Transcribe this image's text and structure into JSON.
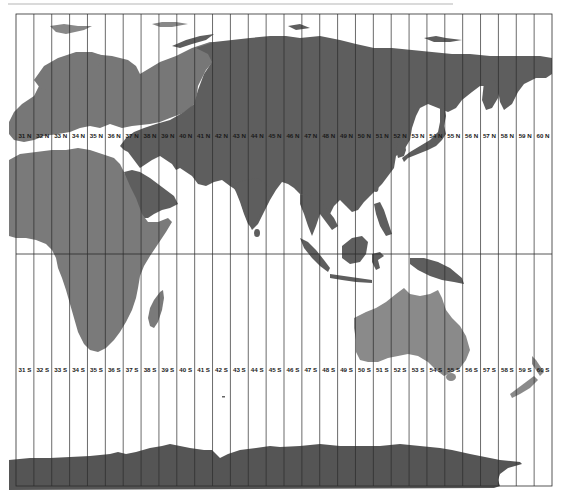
{
  "map": {
    "title": "UTM zones 31-60 (Eastern Hemisphere)",
    "projection_note": "Equirectangular map with UTM zone boundaries",
    "frame": {
      "left": 16,
      "top": 14,
      "right": 552,
      "bottom": 486
    },
    "equator_y": 254,
    "zone_count": 30,
    "colors": {
      "background": "#ffffff",
      "land_dark": "#5e5e5e",
      "land_mid": "#6b6b6b",
      "land_light": "#8a8a8a",
      "antarctica": "#555555",
      "grid_line": "#2b2b2b",
      "label_text": "#1a1a1a"
    },
    "north_labels": [
      "31 N",
      "32 N",
      "33 N",
      "34 N",
      "35 N",
      "36 N",
      "37 N",
      "38 N",
      "39 N",
      "40 N",
      "41 N",
      "42 N",
      "43 N",
      "44 N",
      "45 N",
      "46 N",
      "47 N",
      "48 N",
      "49 N",
      "50 N",
      "51 N",
      "52 N",
      "53 N",
      "54 N",
      "55 N",
      "56 N",
      "57 N",
      "58 N",
      "59 N",
      "60 N"
    ],
    "south_labels": [
      "31 S",
      "32 S",
      "33 S",
      "34 S",
      "35 S",
      "36 S",
      "37 S",
      "38 S",
      "39 S",
      "40 S",
      "41 S",
      "42 S",
      "43 S",
      "44 S",
      "45 S",
      "46 S",
      "47 S",
      "48 S",
      "49 S",
      "50 S",
      "51 S",
      "52 S",
      "53 S",
      "54 S",
      "55 S",
      "56 S",
      "57 S",
      "58 S",
      "59 S",
      "60 S"
    ],
    "north_label_y": 138,
    "south_label_y": 372,
    "regions": [
      "Europe",
      "Asia",
      "Africa",
      "Arabian Peninsula",
      "India",
      "Southeast Asia",
      "Japan",
      "Australia",
      "New Zealand",
      "Madagascar",
      "Antarctica"
    ]
  }
}
